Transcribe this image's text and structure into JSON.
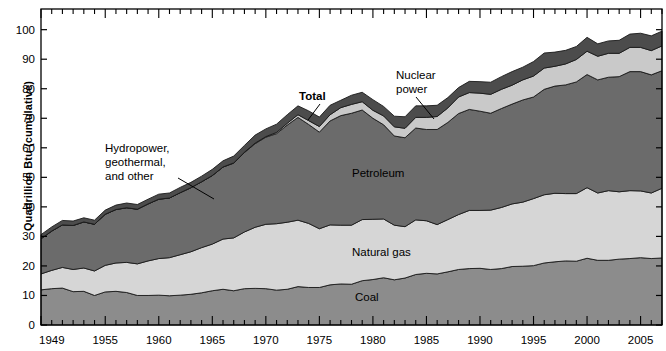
{
  "chart_data": {
    "type": "area",
    "title": "",
    "subtitle": "",
    "xlabel": "",
    "ylabel": "Quadrillion Btu (cumulative)",
    "stacked": true,
    "grid": false,
    "legend_position": "inline-annotations",
    "xlim": [
      1949,
      2007
    ],
    "ylim": [
      0,
      107
    ],
    "yticks": [
      0,
      10,
      20,
      30,
      40,
      50,
      60,
      70,
      80,
      90,
      100
    ],
    "ytick_labels": [
      "0",
      "10",
      "20",
      "30",
      "40",
      "50",
      "60",
      "70",
      "80",
      "90",
      "100"
    ],
    "xtick_labels": [
      "1949",
      "1955",
      "1960",
      "1965",
      "1970",
      "1975",
      "1980",
      "1985",
      "1990",
      "1995",
      "2000",
      "2005"
    ],
    "xtick_values": [
      1949,
      1955,
      1960,
      1965,
      1970,
      1975,
      1980,
      1985,
      1990,
      1995,
      2000,
      2005
    ],
    "x": [
      1949,
      1950,
      1951,
      1952,
      1953,
      1954,
      1955,
      1956,
      1957,
      1958,
      1959,
      1960,
      1961,
      1962,
      1963,
      1964,
      1965,
      1966,
      1967,
      1968,
      1969,
      1970,
      1971,
      1972,
      1973,
      1974,
      1975,
      1976,
      1977,
      1978,
      1979,
      1980,
      1981,
      1982,
      1983,
      1984,
      1985,
      1986,
      1987,
      1988,
      1989,
      1990,
      1991,
      1992,
      1993,
      1994,
      1995,
      1996,
      1997,
      1998,
      1999,
      2000,
      2001,
      2002,
      2003,
      2004,
      2005,
      2006,
      2007
    ],
    "series": [
      {
        "name": "Coal",
        "color": "#8c8c8c",
        "values": [
          11.9,
          12.3,
          12.5,
          11.3,
          11.4,
          10.0,
          11.2,
          11.4,
          11.0,
          10.0,
          10.0,
          10.1,
          9.9,
          10.1,
          10.4,
          10.9,
          11.6,
          12.1,
          11.6,
          12.3,
          12.4,
          12.3,
          11.8,
          12.1,
          13.0,
          12.7,
          12.7,
          13.6,
          13.9,
          13.8,
          15.0,
          15.4,
          16.0,
          15.3,
          15.9,
          17.1,
          17.5,
          17.3,
          18.0,
          18.8,
          19.1,
          19.2,
          18.8,
          19.1,
          19.8,
          19.9,
          20.1,
          21.0,
          21.4,
          21.7,
          21.6,
          22.6,
          21.9,
          21.9,
          22.3,
          22.5,
          22.8,
          22.5,
          22.7
        ]
      },
      {
        "name": "Natural gas",
        "color": "#d6d6d6",
        "values": [
          5.4,
          6.2,
          7.0,
          7.5,
          7.9,
          8.3,
          9.0,
          9.6,
          10.2,
          10.7,
          11.7,
          12.4,
          12.9,
          13.7,
          14.4,
          15.3,
          15.8,
          17.0,
          17.9,
          19.2,
          20.7,
          21.8,
          22.5,
          22.7,
          22.5,
          21.7,
          19.9,
          20.3,
          19.9,
          20.0,
          20.7,
          20.4,
          19.9,
          18.5,
          17.4,
          18.5,
          17.8,
          16.7,
          17.7,
          18.6,
          19.7,
          19.6,
          20.1,
          20.7,
          21.2,
          21.7,
          22.7,
          23.1,
          23.2,
          22.8,
          22.9,
          23.9,
          22.8,
          23.6,
          22.8,
          23.0,
          22.6,
          22.2,
          23.6
        ]
      },
      {
        "name": "Petroleum",
        "color": "#6b6b6b",
        "values": [
          11.9,
          13.3,
          14.4,
          14.9,
          15.6,
          15.8,
          17.3,
          18.1,
          18.5,
          18.5,
          19.3,
          20.1,
          20.2,
          21.0,
          21.7,
          22.3,
          23.2,
          24.4,
          25.3,
          26.9,
          28.3,
          29.5,
          30.5,
          32.9,
          34.8,
          33.5,
          32.7,
          35.2,
          37.1,
          37.9,
          37.1,
          34.2,
          31.9,
          30.2,
          30.1,
          31.1,
          30.9,
          32.2,
          32.9,
          34.2,
          34.2,
          33.6,
          32.8,
          33.5,
          33.8,
          34.6,
          34.4,
          35.7,
          36.3,
          36.8,
          37.8,
          38.3,
          38.3,
          38.4,
          39.0,
          40.3,
          40.4,
          40.0,
          39.8
        ]
      },
      {
        "name": "Nuclear power",
        "color": "#c9c9c9",
        "values": [
          0.0,
          0.0,
          0.0,
          0.0,
          0.0,
          0.0,
          0.0,
          0.0,
          0.0,
          0.0,
          0.0,
          0.0,
          0.0,
          0.0,
          0.0,
          0.0,
          0.0,
          0.0,
          0.1,
          0.1,
          0.2,
          0.2,
          0.4,
          0.6,
          0.9,
          1.3,
          1.9,
          2.1,
          2.7,
          3.0,
          2.8,
          2.7,
          3.0,
          3.1,
          3.2,
          3.6,
          4.1,
          4.4,
          4.9,
          5.6,
          5.7,
          6.1,
          6.4,
          6.5,
          6.4,
          6.8,
          7.1,
          7.2,
          6.7,
          7.1,
          7.6,
          7.9,
          8.0,
          8.1,
          7.9,
          8.2,
          8.2,
          8.2,
          8.4
        ]
      },
      {
        "name": "Hydropower, geothermal, and other",
        "color": "#4c4c4c",
        "values": [
          1.4,
          1.4,
          1.5,
          1.5,
          1.4,
          1.4,
          1.4,
          1.5,
          1.6,
          1.6,
          1.6,
          1.7,
          1.7,
          1.8,
          1.8,
          1.9,
          2.1,
          2.1,
          2.3,
          2.3,
          2.7,
          2.6,
          2.8,
          2.9,
          3.0,
          3.3,
          3.2,
          3.2,
          2.5,
          3.1,
          3.2,
          3.6,
          3.2,
          3.6,
          3.9,
          3.9,
          3.9,
          3.8,
          3.5,
          3.2,
          3.8,
          3.9,
          4.1,
          4.3,
          4.6,
          4.3,
          4.9,
          5.1,
          4.8,
          4.6,
          4.4,
          4.7,
          4.2,
          4.2,
          4.4,
          4.5,
          4.8,
          5.0,
          5.0
        ]
      }
    ],
    "annotations": [
      {
        "text": "Hydropower,\ngeothermal,\nand other",
        "bold": false
      },
      {
        "text": "Total",
        "bold": true
      },
      {
        "text": "Nuclear\npower",
        "bold": false
      },
      {
        "text": "Petroleum",
        "bold": false
      },
      {
        "text": "Natural gas",
        "bold": false
      },
      {
        "text": "Coal",
        "bold": false
      }
    ]
  },
  "axis": {
    "ylabel": "Quadrillion Btu (cumulative)"
  },
  "annotations": {
    "hydro_line1": "Hydropower,",
    "hydro_line2": "geothermal,",
    "hydro_line3": "and other",
    "total": "Total",
    "nuclear_line1": "Nuclear",
    "nuclear_line2": "power",
    "petroleum": "Petroleum",
    "natural_gas": "Natural gas",
    "coal": "Coal"
  }
}
